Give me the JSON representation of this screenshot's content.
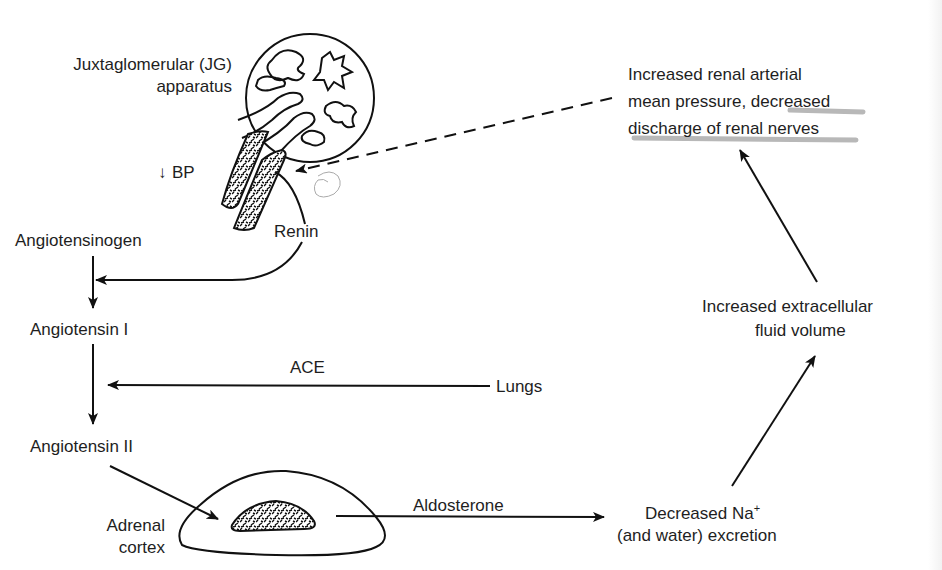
{
  "diagram": {
    "type": "flowchart",
    "topic": "renin-angiotensin-aldosterone",
    "colors": {
      "ink": "#111111",
      "text": "#1e1e1e",
      "highlight": "#b8b8b8",
      "background": "#ffffff"
    },
    "nodes": {
      "jg_line1": "Juxtaglomerular (JG)",
      "jg_line2": "apparatus",
      "bp_arrow": "↓",
      "bp_label": "BP",
      "renin": "Renin",
      "angiotensinogen": "Angiotensinogen",
      "angiotensin1": "Angiotensin I",
      "ace": "ACE",
      "lungs": "Lungs",
      "angiotensin2": "Angiotensin II",
      "adrenal_line1": "Adrenal",
      "adrenal_line2": "cortex",
      "aldosterone": "Aldosterone",
      "na_line1_a": "Decreased Na",
      "na_sup": "+",
      "na_line2": "(and water) excretion",
      "ecf_line1": "Increased extracellular",
      "ecf_line2": "fluid volume",
      "feedback_line1": "Increased renal arterial",
      "feedback_line2": "mean pressure, decreased",
      "feedback_line3": "discharge of renal nerves"
    },
    "edges": [
      {
        "from": "Angiotensinogen",
        "to": "Angiotensin I",
        "style": "solid"
      },
      {
        "from": "Renin",
        "to": "Angiotensinogen→Angiotensin I",
        "style": "solid"
      },
      {
        "from": "Angiotensin I",
        "to": "Angiotensin II",
        "style": "solid"
      },
      {
        "from": "Lungs",
        "to": "Angiotensin I→Angiotensin II",
        "label": "ACE",
        "style": "solid"
      },
      {
        "from": "Angiotensin II",
        "to": "Adrenal cortex",
        "style": "solid"
      },
      {
        "from": "Adrenal cortex",
        "to": "Decreased Na+ (and water) excretion",
        "label": "Aldosterone",
        "style": "solid"
      },
      {
        "from": "Decreased Na+ (and water) excretion",
        "to": "Increased extracellular fluid volume",
        "style": "solid"
      },
      {
        "from": "Increased extracellular fluid volume",
        "to": "Increased renal arterial mean pressure",
        "style": "solid"
      },
      {
        "from": "Increased renal arterial mean pressure",
        "to": "JG apparatus",
        "style": "dashed"
      }
    ]
  }
}
